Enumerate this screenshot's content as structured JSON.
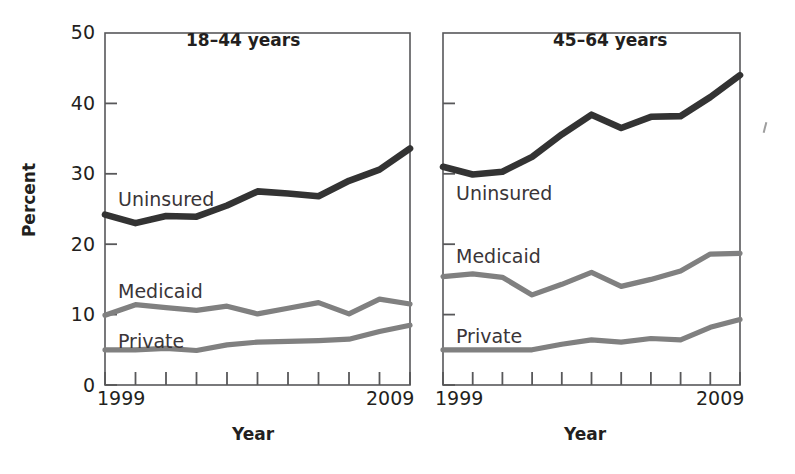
{
  "figure": {
    "background_color": "#ffffff",
    "axis_color": "#58585a",
    "uninsured_color": "#333333",
    "medicaid_color": "#808080",
    "private_color": "#808080"
  },
  "axes": {
    "ylabel": "Percent",
    "xlabel_left": "Year",
    "xlabel_right": "Year",
    "yticks": [
      "0",
      "10",
      "20",
      "30",
      "40",
      "50"
    ],
    "ytick_values": [
      0,
      10,
      20,
      30,
      40,
      50
    ],
    "xtick_first": "1999",
    "xtick_last": "2009",
    "ylim": [
      0,
      50
    ],
    "xlim": [
      1999,
      2009
    ],
    "grid": "off",
    "legend_position": "inline-labels"
  },
  "panels": [
    {
      "title": "18–44 years",
      "series_labels": {
        "uninsured": "Uninsured",
        "medicaid": "Medicaid",
        "private": "Private"
      }
    },
    {
      "title": "45–64 years",
      "series_labels": {
        "uninsured": "Uninsured",
        "medicaid": "Medicaid",
        "private": "Private"
      }
    }
  ],
  "chart_data": [
    {
      "type": "line",
      "title": "18–44 years",
      "xlabel": "Year",
      "ylabel": "Percent",
      "xlim": [
        1999,
        2009
      ],
      "ylim": [
        0,
        50
      ],
      "grid": "off",
      "legend_position": "inline-labels",
      "x": [
        1999,
        2000,
        2001,
        2002,
        2003,
        2004,
        2005,
        2006,
        2007,
        2008,
        2009
      ],
      "categories": [
        "1999",
        "2000",
        "2001",
        "2002",
        "2003",
        "2004",
        "2005",
        "2006",
        "2007",
        "2008",
        "2009"
      ],
      "series": [
        {
          "name": "Uninsured",
          "color": "#333333",
          "values": [
            24.2,
            23.0,
            24.0,
            23.9,
            25.5,
            27.5,
            27.2,
            26.8,
            29.0,
            30.6,
            33.6
          ]
        },
        {
          "name": "Medicaid",
          "color": "#808080",
          "values": [
            9.9,
            11.4,
            11.0,
            10.6,
            11.2,
            10.1,
            10.9,
            11.7,
            10.1,
            12.2,
            11.5
          ]
        },
        {
          "name": "Private",
          "color": "#808080",
          "values": [
            5.0,
            5.0,
            5.2,
            4.9,
            5.7,
            6.1,
            6.2,
            6.3,
            6.5,
            7.6,
            8.5
          ]
        }
      ]
    },
    {
      "type": "line",
      "title": "45–64 years",
      "xlabel": "Year",
      "ylabel": "Percent",
      "xlim": [
        1999,
        2009
      ],
      "ylim": [
        0,
        50
      ],
      "grid": "off",
      "legend_position": "inline-labels",
      "x": [
        1999,
        2000,
        2001,
        2002,
        2003,
        2004,
        2005,
        2006,
        2007,
        2008,
        2009
      ],
      "categories": [
        "1999",
        "2000",
        "2001",
        "2002",
        "2003",
        "2004",
        "2005",
        "2006",
        "2007",
        "2008",
        "2009"
      ],
      "series": [
        {
          "name": "Uninsured",
          "color": "#333333",
          "values": [
            31.0,
            29.9,
            30.3,
            32.4,
            35.6,
            38.4,
            36.5,
            38.1,
            38.2,
            40.9,
            44.0
          ]
        },
        {
          "name": "Medicaid",
          "color": "#808080",
          "values": [
            15.4,
            15.8,
            15.3,
            12.8,
            14.3,
            16.0,
            14.0,
            15.0,
            16.2,
            18.6,
            18.7
          ]
        },
        {
          "name": "Private",
          "color": "#808080",
          "values": [
            5.0,
            5.0,
            5.0,
            5.0,
            5.8,
            6.4,
            6.1,
            6.6,
            6.4,
            8.2,
            9.3
          ]
        }
      ]
    }
  ]
}
